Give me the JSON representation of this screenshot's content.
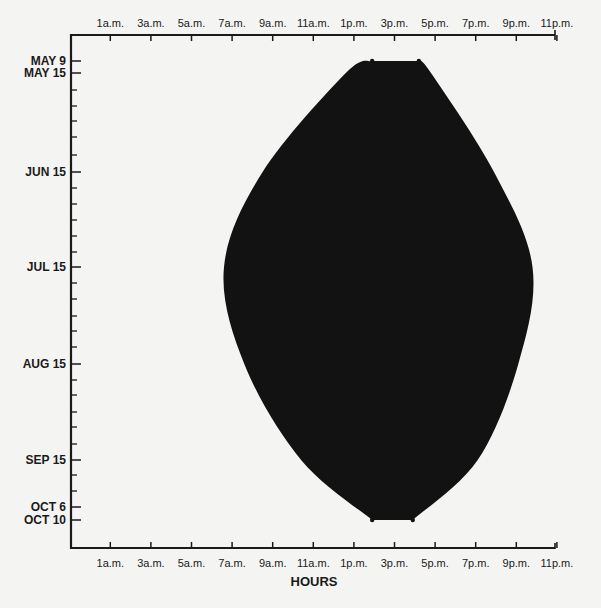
{
  "chart_data": {
    "type": "area",
    "title": "",
    "xlabel": "HOURS",
    "ylabel": "",
    "x_unit": "hour of day (0-24)",
    "x_tick_labels_top": [
      "1a.m.",
      "3a.m.",
      "5a.m.",
      "7a.m.",
      "9a.m.",
      "11a.m.",
      "1p.m.",
      "3p.m.",
      "5p.m.",
      "7p.m.",
      "9p.m.",
      "11p.m."
    ],
    "x_tick_labels_bottom": [
      "1a.m.",
      "3a.m.",
      "5a.m.",
      "7a.m.",
      "9a.m.",
      "11a.m.",
      "1p.m.",
      "3p.m.",
      "5p.m.",
      "7p.m.",
      "9p.m.",
      "11p.m."
    ],
    "x_tick_hours": [
      1,
      3,
      5,
      7,
      9,
      11,
      13,
      15,
      17,
      19,
      21,
      23
    ],
    "y_tick_labels": [
      "MAY 9",
      "MAY 15",
      "JUN 15",
      "JUL 15",
      "AUG 15",
      "SEP 15",
      "OCT 6",
      "OCT 10"
    ],
    "y_tick_daynum": [
      0,
      6,
      37,
      67,
      98,
      129,
      150,
      154
    ],
    "xlim": [
      0,
      23.5
    ],
    "grid": false,
    "legend": null,
    "fill_color": "#121212",
    "series": [
      {
        "name": "active period (start hour / end hour by date)",
        "dates": [
          "MAY 9",
          "MAY 15",
          "JUN 15",
          "JUL 15",
          "AUG 15",
          "SEP 15",
          "OCT 10"
        ],
        "start_hour": [
          13.9,
          12.6,
          8.5,
          6.6,
          7.6,
          10.4,
          13.9
        ],
        "end_hour": [
          16.2,
          16.8,
          19.9,
          21.8,
          21.1,
          19.1,
          15.9
        ]
      }
    ],
    "annotations": []
  }
}
